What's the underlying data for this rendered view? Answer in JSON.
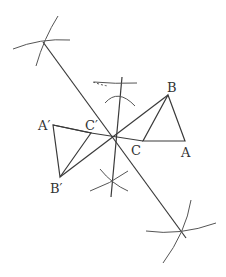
{
  "diagram": {
    "type": "geometric-construction",
    "colors": {
      "stroke": "#3a3a3a",
      "text": "#333333",
      "background": "#ffffff"
    },
    "labels": {
      "A": "A",
      "B": "B",
      "C": "C",
      "A_prime": "A′",
      "B_prime": "B′",
      "C_prime": "C′"
    },
    "points": {
      "A": [
        185,
        141
      ],
      "B": [
        168,
        95
      ],
      "C": [
        143,
        141
      ],
      "A_prime": [
        53,
        125
      ],
      "B_prime": [
        60,
        177
      ],
      "C_prime": [
        91,
        133
      ],
      "O": [
        114,
        136
      ]
    }
  }
}
